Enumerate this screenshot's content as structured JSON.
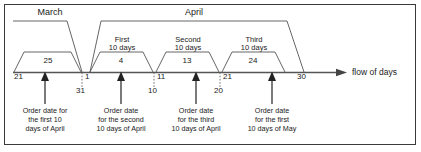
{
  "figure": {
    "axis": {
      "label": "flow of days",
      "ticks": [
        {
          "id": "t21mar",
          "value": "21"
        },
        {
          "id": "t31mar",
          "value": "31"
        },
        {
          "id": "t1apr",
          "value": "1"
        },
        {
          "id": "t10apr",
          "value": "10"
        },
        {
          "id": "t11apr",
          "value": "11"
        },
        {
          "id": "t20apr",
          "value": "20"
        },
        {
          "id": "t21apr",
          "value": "21"
        },
        {
          "id": "t30apr",
          "value": "30"
        }
      ]
    },
    "months": [
      {
        "id": "march",
        "label": "March"
      },
      {
        "id": "april",
        "label": "April"
      }
    ],
    "periods": [
      {
        "id": "march-last",
        "label_line1": "",
        "label_line2": "",
        "value": "25"
      },
      {
        "id": "april-first",
        "label_line1": "First",
        "label_line2": "10 days",
        "value": "4"
      },
      {
        "id": "april-second",
        "label_line1": "Second",
        "label_line2": "10 days",
        "value": "13"
      },
      {
        "id": "april-third",
        "label_line1": "Third",
        "label_line2": "10 days",
        "value": "24"
      }
    ],
    "notes": [
      {
        "id": "note-1",
        "line1": "Order date for",
        "line2": "the first 10",
        "line3": "days of April"
      },
      {
        "id": "note-2",
        "line1": "Order date",
        "line2": "for the second",
        "line3": "10 days of April"
      },
      {
        "id": "note-3",
        "line1": "Order date",
        "line2": "for the third",
        "line3": "10 days of April"
      },
      {
        "id": "note-4",
        "line1": "Order date",
        "line2": "for the first",
        "line3": "10 days of May"
      }
    ],
    "colors": {
      "line": "#555555",
      "axis": "#555555",
      "text": "#1a1a1a",
      "frame": "#3a3a3a",
      "background": "#ffffff"
    }
  }
}
